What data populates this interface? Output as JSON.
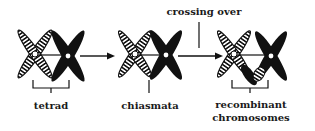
{
  "diagram": {
    "stages": [
      {
        "id": "tetrad",
        "label": "tetrad"
      },
      {
        "id": "chiasmata",
        "label": "chiasmata"
      },
      {
        "id": "recombinant",
        "label_line1": "recombinant",
        "label_line2": "chromosomes"
      }
    ],
    "annotation": "crossing over",
    "colors": {
      "ink": "#111111",
      "background": "#ffffff",
      "hatch_light": "#ffffff"
    }
  }
}
